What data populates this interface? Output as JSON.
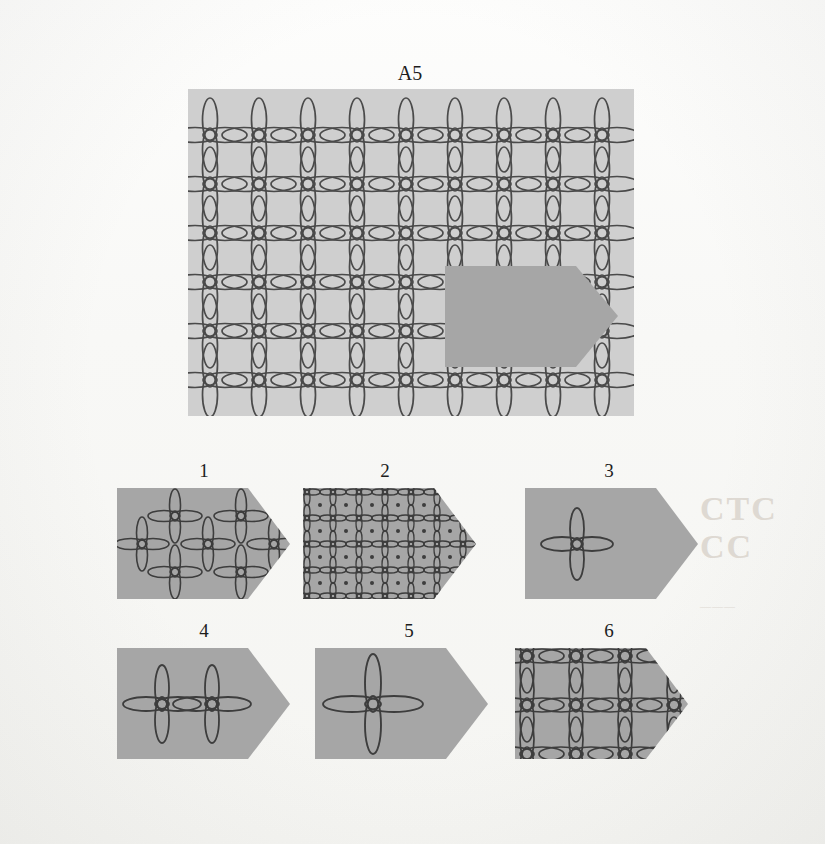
{
  "puzzle": {
    "title": "A5",
    "type": "pattern-completion",
    "prompt_label": "A5",
    "colors": {
      "page_background": "#faf9f7",
      "panel_fill": "#cfcfcf",
      "cutout_fill": "#a6a6a6",
      "option_fill": "#a6a6a6",
      "stroke": "#4a4a4a",
      "label_text": "#1d1d1d"
    },
    "stimulus": {
      "name": "main-pattern-panel",
      "description": "Rectangular panel filled with a lattice of overlapping ellipse petals forming four-petal flowers at each grid intersection, with a pentagon-shaped piece removed (shown as solid darker gray).",
      "grid": {
        "columns": 9,
        "rows": 6,
        "spacing_px": 49,
        "petal_long_px": 44,
        "petal_short_px": 14
      },
      "cutout": {
        "shape": "pentagon-arrow",
        "position": "right-center"
      }
    },
    "options": [
      {
        "number": "1",
        "name": "option-1",
        "motif": "scattered-separate-flowers",
        "flower_count": 7,
        "matches": false
      },
      {
        "number": "2",
        "name": "option-2",
        "motif": "dense-small-grid-with-dots",
        "columns": 6,
        "rows": 4,
        "matches": false
      },
      {
        "number": "3",
        "name": "option-3",
        "motif": "single-flower-centered",
        "flower_count": 1,
        "matches": false
      },
      {
        "number": "4",
        "name": "option-4",
        "motif": "two-flowers-joined-horizontally",
        "flower_count": 2,
        "matches": false
      },
      {
        "number": "5",
        "name": "option-5",
        "motif": "single-large-flower",
        "flower_count": 1,
        "matches": false
      },
      {
        "number": "6",
        "name": "option-6",
        "motif": "matching-lattice-grid",
        "columns": 4,
        "rows": 3,
        "matches": true
      }
    ]
  }
}
